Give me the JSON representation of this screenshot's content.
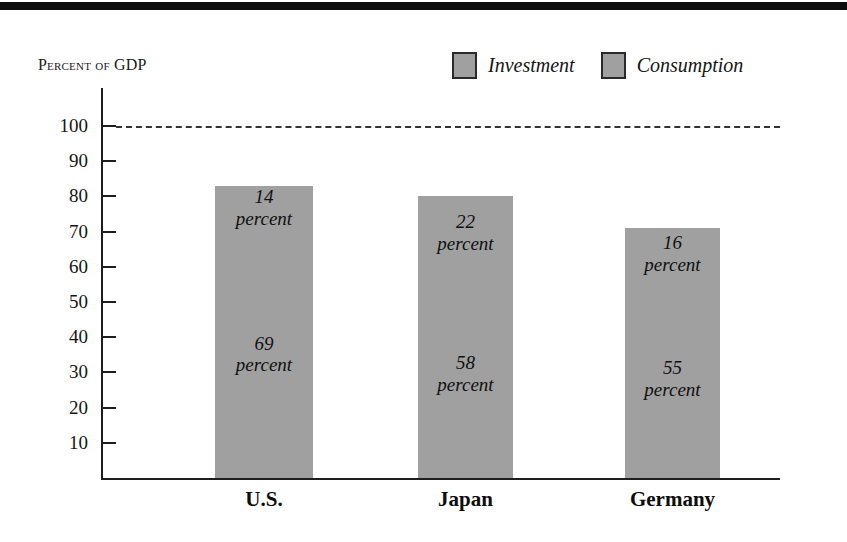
{
  "figure": {
    "top_rule": "decorative-black-rule",
    "axis_title": "Percent of GDP",
    "axis_title_caps_part": "GDP",
    "axis_title_smallcaps_part": "Percent of "
  },
  "legend": {
    "position": "top-right",
    "items": [
      {
        "label": "Investment",
        "color": "#a0a0a0"
      },
      {
        "label": "Consumption",
        "color": "#a0a0a0"
      }
    ]
  },
  "axes": {
    "y_ticks": [
      100,
      90,
      80,
      70,
      60,
      50,
      40,
      30,
      20,
      10
    ],
    "y_tick_labels": [
      "100",
      "90",
      "80",
      "70",
      "60",
      "50",
      "40",
      "30",
      "20",
      "10"
    ],
    "x_labels": [
      "U.S.",
      "Japan",
      "Germany"
    ],
    "reference_line_value": 100
  },
  "chart_data": {
    "type": "bar",
    "stacked": true,
    "title": "",
    "subtitle": "",
    "xlabel": "",
    "ylabel": "Percent of GDP",
    "ylim": [
      0,
      105
    ],
    "y_ticks": [
      10,
      20,
      30,
      40,
      50,
      60,
      70,
      80,
      90,
      100
    ],
    "grid": false,
    "legend_position": "top-right",
    "reference_lines": [
      {
        "value": 100,
        "style": "dashed",
        "label": ""
      }
    ],
    "categories": [
      "U.S.",
      "Japan",
      "Germany"
    ],
    "series": [
      {
        "name": "Investment",
        "values": [
          14,
          22,
          16
        ],
        "color": "#a0a0a0"
      },
      {
        "name": "Consumption",
        "values": [
          69,
          58,
          55
        ],
        "color": "#a0a0a0"
      }
    ],
    "totals": [
      83,
      80,
      71
    ],
    "unit_label": "percent",
    "bars": [
      {
        "category": "U.S.",
        "total": 83,
        "segments": [
          {
            "series": "Investment",
            "value": 14,
            "value_text": "14",
            "unit_text": "percent"
          },
          {
            "series": "Consumption",
            "value": 69,
            "value_text": "69",
            "unit_text": "percent"
          }
        ]
      },
      {
        "category": "Japan",
        "total": 80,
        "segments": [
          {
            "series": "Investment",
            "value": 22,
            "value_text": "22",
            "unit_text": "percent"
          },
          {
            "series": "Consumption",
            "value": 58,
            "value_text": "58",
            "unit_text": "percent"
          }
        ]
      },
      {
        "category": "Germany",
        "total": 71,
        "segments": [
          {
            "series": "Investment",
            "value": 16,
            "value_text": "16",
            "unit_text": "percent"
          },
          {
            "series": "Consumption",
            "value": 55,
            "value_text": "55",
            "unit_text": "percent"
          }
        ]
      }
    ]
  },
  "colors": {
    "bar_fill": "#a0a0a0",
    "axis": "#1e1e1e",
    "text": "#111111",
    "rule": "#0d0d0d"
  }
}
